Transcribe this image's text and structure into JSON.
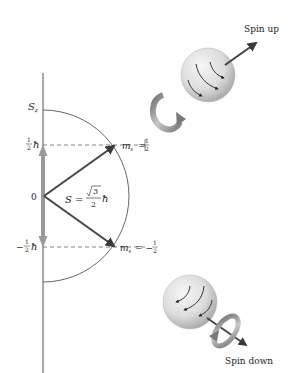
{
  "figure": {
    "type": "spin angular momentum vector diagram",
    "axis_label": "S",
    "axis_label_sub": "z",
    "origin_label": "0",
    "upper_level": {
      "frac_num": "1",
      "frac_den": "2",
      "sign": "",
      "symbol": "ħ"
    },
    "lower_level": {
      "frac_num": "1",
      "frac_den": "2",
      "sign": "−",
      "symbol": "ħ"
    },
    "spin_magnitude": {
      "lhs": "S =",
      "root": "3",
      "den": "2",
      "symbol": "ħ"
    },
    "ms_upper": {
      "lhs": "m",
      "sub": "s",
      "eq": "=",
      "num": "1",
      "den": "2",
      "sign": ""
    },
    "ms_lower": {
      "lhs": "m",
      "sub": "s",
      "eq": "= −",
      "num": "1",
      "den": "2",
      "sign": "−"
    },
    "spin_up_label": "Spin up",
    "spin_down_label": "Spin down"
  },
  "colors": {
    "axis": "#555555",
    "arc": "#555555",
    "vector": "#444444",
    "sz_arrow": "#9a9a9a",
    "sphere_light": "#f2f2f2",
    "sphere_dark": "#a8a8a8",
    "rotation_arrow": "#8a8a8a"
  }
}
